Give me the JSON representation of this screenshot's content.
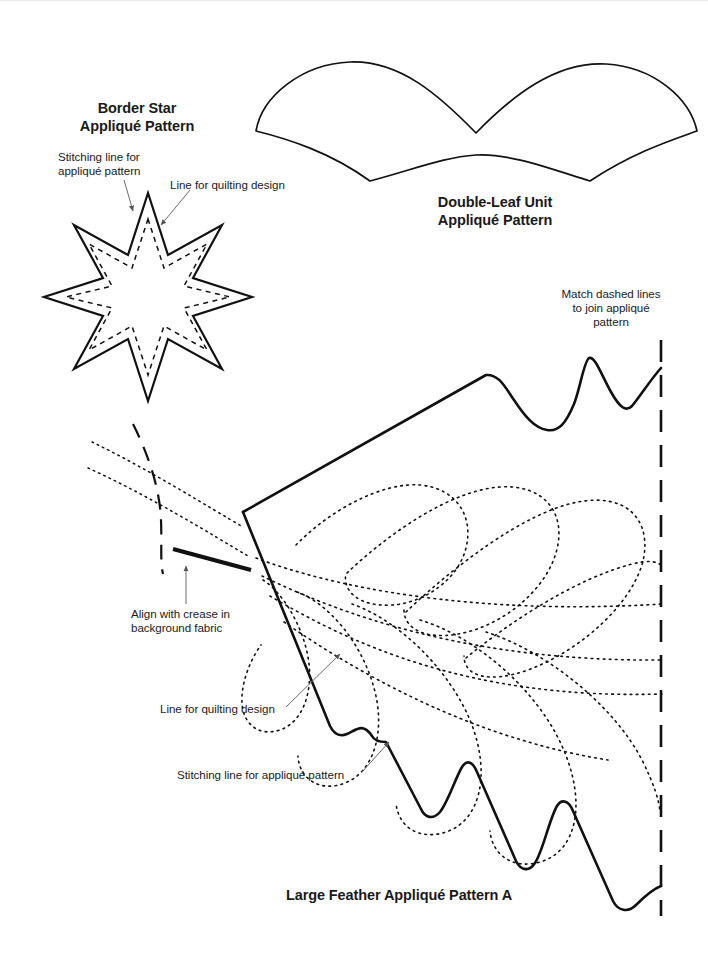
{
  "page": {
    "background_color": "#ffffff",
    "ink_color": "#1a1a1a",
    "width": 708,
    "height": 953
  },
  "titles": {
    "border_star": "Border Star\nAppliqué Pattern",
    "double_leaf": "Double-Leaf Unit\nAppliqué Pattern",
    "large_feather": "Large Feather Appliqué Pattern A"
  },
  "annotations": {
    "stitching_line_star": "Stitching line for\nappliqué pattern",
    "quilting_line_star": "Line for quilting design",
    "match_dashed_lines": "Match dashed lines\nto join appliqué\npattern",
    "align_with_crease": "Align with crease in\nbackground fabric",
    "quilting_line_feather": "Line for quilting design",
    "stitching_line_feather": "Stitching line for appliqué pattern"
  },
  "figures": {
    "border_star": {
      "name": "border-star",
      "type": "eight-point-star",
      "center": [
        148,
        297
      ],
      "outer_radius": 104,
      "inner_radius": 52,
      "points": 8,
      "rotation_deg": -90,
      "outline_style": "solid",
      "outline_width": 2.2,
      "inner_guide_inset": 16,
      "inner_guide_style": "dashed"
    },
    "double_leaf": {
      "name": "double-leaf-unit",
      "type": "closed-wave-band",
      "left_tip": [
        256,
        131
      ],
      "right_tip": [
        697,
        131
      ],
      "upper_peak_1": [
        350,
        62
      ],
      "upper_valley": [
        476,
        133
      ],
      "upper_peak_2": [
        606,
        64
      ],
      "lower_valley_1": [
        370,
        181
      ],
      "lower_peak": [
        476,
        155
      ],
      "lower_valley_2": [
        590,
        182
      ],
      "outline_style": "solid",
      "outline_width": 1.6
    },
    "large_feather": {
      "name": "large-feather-pattern-a",
      "spine_start": [
        243,
        512
      ],
      "top_ridge_apex": [
        486,
        375
      ],
      "zigzag_peaks": [
        [
          588,
          358
        ],
        [
          661,
          368
        ]
      ],
      "zigzag_valleys": [
        [
          558,
          430
        ],
        [
          628,
          410
        ]
      ],
      "join_line_x": 661,
      "join_line_from_y": 340,
      "join_line_to_y": 915,
      "join_line_style": "dashed",
      "crease_mark_from": [
        173,
        549
      ],
      "crease_mark_to": [
        251,
        570
      ],
      "crease_mark_width": 4,
      "left_dashed_curve": [
        [
          134,
          424
        ],
        [
          158,
          500
        ],
        [
          163,
          573
        ]
      ],
      "plume_style": "dotted",
      "outline_style": "solid",
      "outline_width": 2.4,
      "plume_count_upper": 3,
      "plume_count_lower": 3
    }
  },
  "leaders": {
    "stitching_star": {
      "from": [
        124,
        178
      ],
      "to": [
        132,
        212
      ],
      "arrow": true
    },
    "quilting_star": {
      "from": [
        188,
        190
      ],
      "to": [
        160,
        226
      ],
      "arrow": true
    },
    "align_crease": {
      "from": [
        186,
        603
      ],
      "to": [
        186,
        566
      ],
      "arrow": true
    },
    "quilting_feather": {
      "from": [
        288,
        706
      ],
      "to": [
        339,
        655
      ],
      "arrow": true
    },
    "stitching_feather": {
      "from": [
        360,
        772
      ],
      "to": [
        388,
        742
      ],
      "arrow": true
    }
  }
}
